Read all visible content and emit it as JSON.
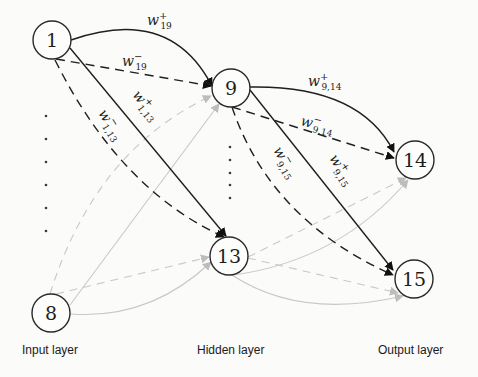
{
  "diagram": {
    "type": "neural-network",
    "nodes": [
      {
        "id": "1",
        "label": "1",
        "layer": "input",
        "cx": 52,
        "cy": 40,
        "r": 19
      },
      {
        "id": "8",
        "label": "8",
        "layer": "input",
        "cx": 51,
        "cy": 313,
        "r": 19
      },
      {
        "id": "9",
        "label": "9",
        "layer": "hidden",
        "cx": 231,
        "cy": 88,
        "r": 19
      },
      {
        "id": "13",
        "label": "13",
        "layer": "hidden",
        "cx": 229,
        "cy": 256,
        "r": 19
      },
      {
        "id": "14",
        "label": "14",
        "layer": "output",
        "cx": 415,
        "cy": 160,
        "r": 19
      },
      {
        "id": "15",
        "label": "15",
        "layer": "output",
        "cx": 414,
        "cy": 279,
        "r": 19
      }
    ],
    "edges": [
      {
        "from": "1",
        "to": "9",
        "sign": "+",
        "style": "solid",
        "weight": "strong",
        "label": {
          "base": "w",
          "sup": "+",
          "sub": "19"
        }
      },
      {
        "from": "1",
        "to": "9",
        "sign": "-",
        "style": "dashed",
        "weight": "strong",
        "label": {
          "base": "w",
          "sup": "−",
          "sub": "19"
        }
      },
      {
        "from": "1",
        "to": "13",
        "sign": "+",
        "style": "solid",
        "weight": "strong",
        "label": {
          "base": "w",
          "sup": "+",
          "sub": "1,13"
        }
      },
      {
        "from": "1",
        "to": "13",
        "sign": "-",
        "style": "dashed",
        "weight": "strong",
        "label": {
          "base": "w",
          "sup": "−",
          "sub": "1,13"
        }
      },
      {
        "from": "9",
        "to": "14",
        "sign": "+",
        "style": "solid",
        "weight": "strong",
        "label": {
          "base": "w",
          "sup": "+",
          "sub": "9,14"
        }
      },
      {
        "from": "9",
        "to": "14",
        "sign": "-",
        "style": "dashed",
        "weight": "strong",
        "label": {
          "base": "w",
          "sup": "−",
          "sub": "9,14"
        }
      },
      {
        "from": "9",
        "to": "15",
        "sign": "+",
        "style": "solid",
        "weight": "strong",
        "label": {
          "base": "w",
          "sup": "+",
          "sub": "9,15"
        }
      },
      {
        "from": "9",
        "to": "15",
        "sign": "-",
        "style": "dashed",
        "weight": "strong",
        "label": {
          "base": "w",
          "sup": "−",
          "sub": "9,15"
        }
      },
      {
        "from": "8",
        "to": "9",
        "sign": "+",
        "style": "solid",
        "weight": "faint"
      },
      {
        "from": "8",
        "to": "9",
        "sign": "-",
        "style": "dashed",
        "weight": "faint"
      },
      {
        "from": "8",
        "to": "13",
        "sign": "+",
        "style": "solid",
        "weight": "faint"
      },
      {
        "from": "8",
        "to": "13",
        "sign": "-",
        "style": "dashed",
        "weight": "faint"
      },
      {
        "from": "13",
        "to": "14",
        "sign": "+",
        "style": "solid",
        "weight": "faint"
      },
      {
        "from": "13",
        "to": "14",
        "sign": "-",
        "style": "dashed",
        "weight": "faint"
      },
      {
        "from": "13",
        "to": "15",
        "sign": "+",
        "style": "solid",
        "weight": "faint"
      },
      {
        "from": "13",
        "to": "15",
        "sign": "-",
        "style": "dashed",
        "weight": "faint"
      }
    ],
    "ellipsis_columns": [
      {
        "layer": "input",
        "x": 46,
        "ys": [
          116,
          139,
          162,
          185,
          208,
          231
        ]
      },
      {
        "layer": "hidden",
        "x": 230,
        "ys": [
          147,
          160,
          173,
          185,
          198
        ]
      }
    ],
    "colors": {
      "strong_edge": "#1f1f1f",
      "faint_edge": "#c8c8c8",
      "background": "#fbfbfa"
    }
  },
  "layers": {
    "input": "Input layer",
    "hidden": "Hidden layer",
    "output": "Output layer"
  },
  "weights": {
    "w19_plus": {
      "base": "w",
      "sup": "+",
      "sub": "19"
    },
    "w19_minus": {
      "base": "w",
      "sup": "−",
      "sub": "19"
    },
    "w1_13_plus": {
      "base": "w",
      "sup": "+",
      "sub": "1,13"
    },
    "w1_13_minus": {
      "base": "w",
      "sup": "−",
      "sub": "1,13"
    },
    "w9_14_plus": {
      "base": "w",
      "sup": "+",
      "sub": "9,14"
    },
    "w9_14_minus": {
      "base": "w",
      "sup": "−",
      "sub": "9,14"
    },
    "w9_15_plus": {
      "base": "w",
      "sup": "+",
      "sub": "9,15"
    },
    "w9_15_minus": {
      "base": "w",
      "sup": "−",
      "sub": "9,15"
    }
  },
  "node_labels": {
    "n1": "1",
    "n8": "8",
    "n9": "9",
    "n13": "13",
    "n14": "14",
    "n15": "15"
  }
}
